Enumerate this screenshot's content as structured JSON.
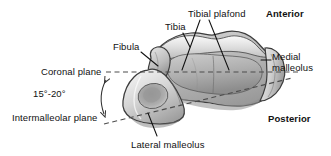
{
  "figure": {
    "background_color": "#ffffff",
    "width": 331,
    "height": 156
  },
  "labels": {
    "tibial_plafond": "Tibial plafond",
    "anterior": "Anterior",
    "tibia": "Tibia",
    "fibula": "Fibula",
    "medial_malleolus": "Medial\nmalleolus",
    "coronal_plane": "Coronal plane",
    "angle": "15°-20°",
    "intermalleolar_plane": "Intermalleolar plane",
    "posterior": "Posterior",
    "lateral_malleolus": "Lateral malleolus"
  },
  "colors": {
    "text": "#111111",
    "outline": "#3a3a3a",
    "dashed_line": "#555555",
    "bone_light": "#f2f2f2",
    "bone_mid": "#c9c9c9",
    "bone_dark": "#8e8e8e",
    "bone_shadow": "#6f6f6f"
  },
  "annotations": {
    "planes": [
      {
        "name": "Coronal plane",
        "style": "dashed",
        "orientation": "horizontal"
      },
      {
        "name": "Intermalleolar plane",
        "style": "dashed",
        "orientation": "oblique"
      }
    ],
    "angle_between_planes": "15°-20°",
    "orientation_markers": [
      "Anterior",
      "Posterior"
    ]
  }
}
